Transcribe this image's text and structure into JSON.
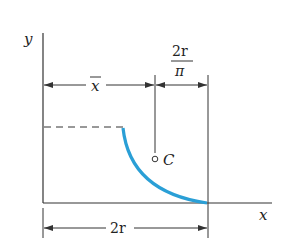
{
  "diagram": {
    "axes": {
      "x_label": "x",
      "y_label": "y"
    },
    "dimensions": {
      "xbar_label": "x",
      "xbar_overline": true,
      "offset_numerator": "2r",
      "offset_denominator": "π",
      "base_width_label": "2r"
    },
    "points": {
      "centroid_label": "C"
    },
    "colors": {
      "arc": "#2a9fd6",
      "lines": "#333333",
      "background": "#ffffff"
    }
  }
}
